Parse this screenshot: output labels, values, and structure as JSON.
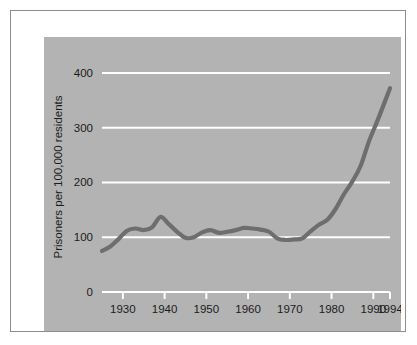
{
  "figure": {
    "panel_color": "#b3b3b3",
    "frame_color": "#8d8d8d",
    "page_color": "#ffffff"
  },
  "chart_data": {
    "type": "line",
    "title": "",
    "subtitle": "",
    "xlabel": "",
    "ylabel": "Prisoners per 100,000 residents",
    "xlim": [
      1925,
      1994
    ],
    "ylim": [
      0,
      420
    ],
    "grid": true,
    "grid_axis": "y",
    "legend": false,
    "legend_position": "none",
    "line_color": "#6e6e6e",
    "grid_color": "#ffffff",
    "yticks": [
      0,
      100,
      200,
      300,
      400
    ],
    "ytick_labels": [
      "0",
      "100",
      "200",
      "300",
      "400"
    ],
    "xticks": [
      1930,
      1940,
      1950,
      1960,
      1970,
      1980,
      1990,
      1994
    ],
    "xtick_labels": [
      "1930",
      "1940",
      "1950",
      "1960",
      "1970",
      "1980",
      "1990",
      "1994"
    ],
    "series": [
      {
        "name": "Prisoners per 100,000 residents",
        "color": "#6e6e6e",
        "x": [
          1925,
          1927,
          1929,
          1931,
          1933,
          1935,
          1937,
          1939,
          1941,
          1943,
          1945,
          1947,
          1949,
          1951,
          1953,
          1955,
          1957,
          1959,
          1961,
          1963,
          1965,
          1967,
          1969,
          1971,
          1973,
          1975,
          1977,
          1979,
          1981,
          1983,
          1985,
          1987,
          1989,
          1991,
          1994
        ],
        "values": [
          75,
          83,
          97,
          112,
          116,
          113,
          118,
          137,
          124,
          110,
          99,
          100,
          109,
          113,
          108,
          110,
          113,
          117,
          116,
          114,
          110,
          98,
          95,
          96,
          98,
          111,
          123,
          132,
          152,
          179,
          202,
          231,
          276,
          313,
          372
        ]
      }
    ],
    "annotations": []
  }
}
